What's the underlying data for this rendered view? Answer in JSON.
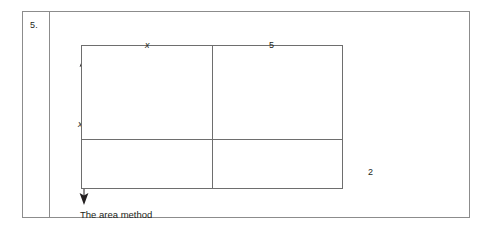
{
  "figure": {
    "question_number": "5.",
    "caption": "The area method",
    "labels": {
      "top_left": "x",
      "top_right": "5",
      "right_side": "2",
      "height": "x"
    },
    "icons": {
      "height_arrow": "double-headed-vertical-arrow-icon"
    },
    "colors": {
      "ink": "#231f20",
      "frame_rule": "#8c8c8c",
      "grid_rule": "#6e6e6e",
      "page_background": "#ffffff"
    },
    "grid": {
      "columns": 2,
      "rows": 2,
      "cells": [
        {
          "name": "top-left",
          "label": ""
        },
        {
          "name": "top-right",
          "label": ""
        },
        {
          "name": "bottom-left",
          "label": ""
        },
        {
          "name": "bottom-right",
          "label": ""
        }
      ]
    }
  }
}
